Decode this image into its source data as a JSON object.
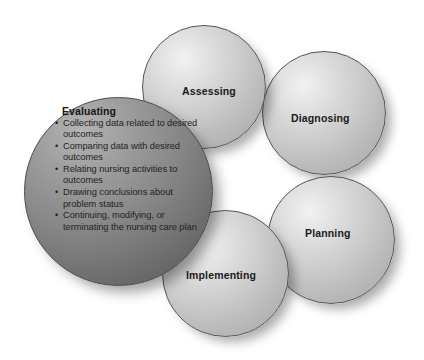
{
  "diagram": {
    "background_color": "#ffffff",
    "label_color": "#1a1a1a",
    "sphere_light_color": "#cbcbcb",
    "sphere_dark_color": "#7e7e7e"
  },
  "spheres": [
    {
      "id": "assessing",
      "label": "Assessing",
      "shade": "light"
    },
    {
      "id": "diagnosing",
      "label": "Diagnosing",
      "shade": "light"
    },
    {
      "id": "planning",
      "label": "Planning",
      "shade": "light"
    },
    {
      "id": "implementing",
      "label": "Implementing",
      "shade": "light"
    },
    {
      "id": "evaluating",
      "label": "Evaluating",
      "shade": "dark"
    }
  ],
  "evaluating": {
    "title": "Evaluating",
    "bullets": [
      "Collecting data related to desired outcomes",
      "Comparing data with desired outcomes",
      "Relating nursing activities to outcomes",
      "Drawing conclusions about problem status",
      "Continuing, modifying, or terminating the nursing care plan"
    ]
  }
}
